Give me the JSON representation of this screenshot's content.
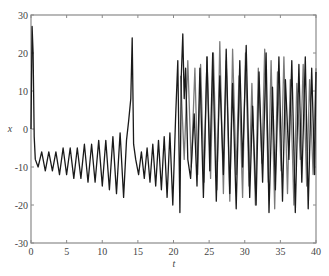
{
  "chart_data": {
    "type": "line",
    "title": "",
    "xlabel": "t",
    "ylabel": "x",
    "xlim": [
      0,
      40
    ],
    "ylim": [
      -30,
      30
    ],
    "xticks": [
      0,
      5,
      10,
      15,
      20,
      25,
      30,
      35,
      40
    ],
    "yticks": [
      30,
      20,
      10,
      0,
      -10,
      -20,
      -30
    ],
    "grid": false,
    "legend": null,
    "colors": {
      "series_black": "#1a1a1a",
      "series_gray": "#7a7a7a",
      "axis": "#8a8a8a"
    },
    "series": [
      {
        "name": "trajectory-1 (black)",
        "description": "Initial spike to ~27 at t≈0.2, drops to ~-8, growing oscillation about -10 (amplitude rises from ~2 to ~8) until t≈13.6, spike to ~24 at t≈14.2; repeats growing oscillation t≈14.7–20.8, spike to ~25 at t≈21.5, then irregular chaotic switching between ~+24 and ~-23 up to t=40",
        "x": [
          0,
          0.15,
          0.3,
          0.45,
          0.6,
          1,
          1.5,
          2,
          2.5,
          3,
          3.5,
          4,
          4.5,
          5,
          5.5,
          6,
          6.5,
          7,
          7.5,
          8,
          8.5,
          9,
          9.5,
          10,
          10.5,
          11,
          11.5,
          12,
          12.5,
          13,
          13.4,
          13.7,
          14.0,
          14.2,
          14.4,
          14.7,
          15.1,
          15.5,
          15.9,
          16.3,
          16.7,
          17.1,
          17.5,
          17.9,
          18.3,
          18.7,
          19.1,
          19.5,
          19.9,
          20.3,
          20.6,
          20.9,
          21.1,
          21.3,
          21.5,
          21.7,
          22.0,
          22.4,
          22.9,
          23.3,
          23.7,
          24.2,
          24.7,
          25.1,
          25.5,
          26.0,
          26.5,
          27.0,
          27.4,
          27.9,
          28.3,
          28.8,
          29.3,
          29.7,
          30.2,
          30.7,
          31.1,
          31.6,
          32.0,
          32.5,
          33.0,
          33.4,
          33.9,
          34.3,
          34.8,
          35.3,
          35.7,
          36.2,
          36.6,
          37.1,
          37.6,
          38.0,
          38.5,
          38.9,
          39.4,
          39.8,
          40
        ],
        "y": [
          0,
          27,
          20,
          -2,
          -8,
          -10,
          -6,
          -11,
          -6,
          -11,
          -6,
          -12,
          -5,
          -12,
          -5,
          -13,
          -5,
          -13,
          -4,
          -14,
          -4,
          -14,
          -3,
          -15,
          -3,
          -16,
          -2,
          -17,
          -1,
          -18,
          -3,
          2,
          8,
          24,
          -4,
          -8,
          -12,
          -6,
          -13,
          -5,
          -14,
          -4,
          -15,
          -3,
          -16,
          -2,
          -18,
          -1,
          -20,
          3,
          18,
          -22,
          14,
          25,
          8,
          16,
          -8,
          -13,
          4,
          -15,
          16,
          -18,
          19,
          -11,
          20,
          -19,
          14,
          -12,
          21,
          -17,
          12,
          -21,
          18,
          -10,
          22,
          -18,
          6,
          -20,
          15,
          -14,
          20,
          -22,
          11,
          -16,
          19,
          -19,
          13,
          -8,
          18,
          -22,
          17,
          -14,
          19,
          -21,
          16,
          -12,
          15
        ]
      },
      {
        "name": "trajectory-2 (gray)",
        "description": "Coincides with the black trajectory up to t≈21, then diverges into a separate chaotic path oscillating between ~+24 and ~-22",
        "x": [
          21.0,
          21.5,
          22.0,
          22.5,
          23.0,
          23.4,
          23.8,
          24.3,
          24.7,
          25.2,
          25.6,
          26.1,
          26.5,
          27.0,
          27.4,
          27.9,
          28.3,
          28.8,
          29.2,
          29.7,
          30.1,
          30.6,
          31.0,
          31.5,
          31.9,
          32.4,
          32.8,
          33.3,
          33.7,
          34.2,
          34.6,
          35.1,
          35.5,
          36.0,
          36.4,
          36.9,
          37.3,
          37.8,
          38.2,
          38.7,
          39.1,
          39.6,
          40
        ],
        "y": [
          14,
          -8,
          18,
          -10,
          16,
          -12,
          17,
          -14,
          19,
          -13,
          20,
          -16,
          23,
          -17,
          18,
          -19,
          21,
          -12,
          14,
          -18,
          20,
          -15,
          12,
          -20,
          16,
          -9,
          21,
          -14,
          18,
          -21,
          15,
          -11,
          19,
          -17,
          13,
          -20,
          12,
          -8,
          17,
          -15,
          13,
          -12,
          16
        ]
      }
    ]
  }
}
